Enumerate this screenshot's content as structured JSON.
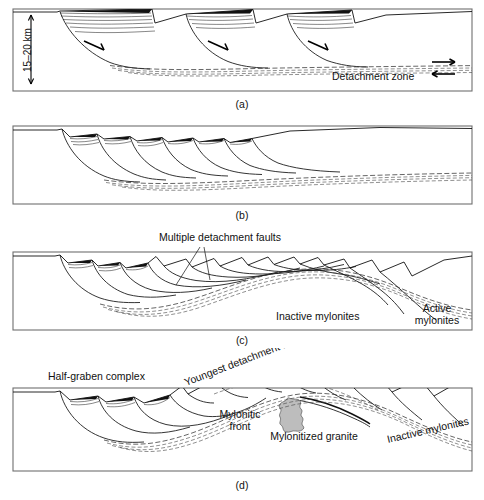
{
  "figure": {
    "panels": [
      {
        "id": "a",
        "caption": "(a)",
        "labels": [
          {
            "name": "detachment-zone-label",
            "text": "Detachment zone"
          },
          {
            "name": "depth-scale-label",
            "text": "15–20 km"
          }
        ],
        "features": [
          "rotated fault blocks",
          "listric normal faults",
          "growth strata wedges",
          "detachment zone",
          "shear-sense arrows"
        ]
      },
      {
        "id": "b",
        "caption": "(b)",
        "labels": [],
        "features": [
          "imbricate listric normal faults",
          "domed detachment",
          "flat hanging wall"
        ]
      },
      {
        "id": "c",
        "caption": "(c)",
        "labels": [
          {
            "name": "multiple-detachment-faults-label",
            "text": "Multiple detachment faults"
          },
          {
            "name": "inactive-mylonites-label",
            "text": "Inactive mylonites"
          },
          {
            "name": "active-mylonites-label-line1",
            "text": "Active"
          },
          {
            "name": "active-mylonites-label-line2",
            "text": "mylonites"
          }
        ],
        "features": [
          "mylonite arch",
          "rider blocks",
          "active and inactive mylonite zones"
        ]
      },
      {
        "id": "d",
        "caption": "(d)",
        "labels": [
          {
            "name": "half-graben-complex-label",
            "text": "Half-graben complex"
          },
          {
            "name": "youngest-detachment-fault-label",
            "text": "Youngest detachment fault"
          },
          {
            "name": "mylonitic-front-label-line1",
            "text": "Mylonitic"
          },
          {
            "name": "mylonitic-front-label-line2",
            "text": "front"
          },
          {
            "name": "mylonitized-granite-label",
            "text": "Mylonitized granite"
          },
          {
            "name": "inactive-mylonites-label",
            "text": "Inactive mylonites"
          }
        ],
        "features": [
          "half-graben complex",
          "mylonitic front",
          "mylonitized granite body",
          "youngest detachment fault",
          "inactive mylonites"
        ]
      }
    ],
    "colors": {
      "frame_stroke": "#6f6f6f",
      "line": "#111111",
      "granite_fill": "#bdbdbd",
      "detachment_stroke": "#333333",
      "background": "#ffffff"
    }
  }
}
